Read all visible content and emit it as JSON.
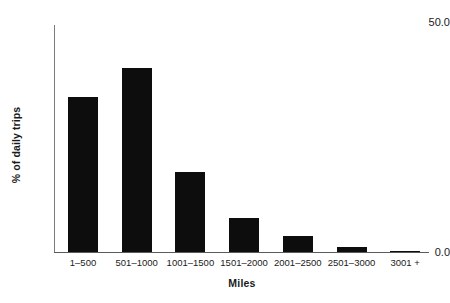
{
  "chart_data": {
    "type": "bar",
    "title": "",
    "xlabel": "Miles",
    "ylabel": "% of daily trips",
    "categories": [
      "1–500",
      "501–1000",
      "1001–1500",
      "1501–2000",
      "2001–2500",
      "2501–3000",
      "3001 +"
    ],
    "values": [
      34.2,
      40.6,
      17.6,
      7.6,
      3.6,
      1.1,
      0.2
    ],
    "ylim": [
      0,
      50
    ],
    "ytick_labels": [
      "50.0",
      "0.0"
    ],
    "ytick_values": [
      50.0,
      0.0
    ],
    "grid": false,
    "legend": false,
    "bar_color": "#0d0d0d",
    "axis_color": "#5a5a5a",
    "background_color": "#ffffff"
  }
}
